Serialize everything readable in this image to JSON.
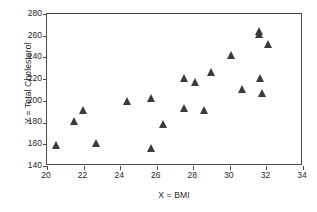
{
  "chart_data": {
    "type": "scatter",
    "title": "",
    "xlabel": "X = BMI",
    "ylabel": "Y = Total Cholesterol",
    "xlim": [
      20,
      34
    ],
    "ylim": [
      140,
      280
    ],
    "xticks": [
      20,
      22,
      24,
      26,
      28,
      30,
      32,
      34
    ],
    "yticks": [
      140,
      160,
      180,
      200,
      220,
      240,
      260,
      280
    ],
    "grid": false,
    "legend": null,
    "marker": "filled-triangle",
    "marker_color": "#3a3a3a",
    "n_points": 20,
    "x": [
      20.5,
      21.5,
      22.0,
      22.7,
      24.4,
      25.7,
      25.7,
      26.4,
      27.5,
      27.5,
      28.1,
      28.6,
      29.0,
      30.1,
      30.7,
      31.6,
      31.6,
      31.7,
      31.8,
      32.1
    ],
    "y": [
      158,
      180,
      190,
      160,
      199,
      201,
      155,
      177,
      220,
      192,
      216,
      190,
      225,
      241,
      210,
      263,
      260,
      220,
      206,
      251
    ],
    "points": [
      {
        "x": 20.5,
        "y": 158
      },
      {
        "x": 21.5,
        "y": 180
      },
      {
        "x": 22.0,
        "y": 190
      },
      {
        "x": 22.7,
        "y": 160
      },
      {
        "x": 24.4,
        "y": 199
      },
      {
        "x": 25.7,
        "y": 201
      },
      {
        "x": 25.7,
        "y": 155
      },
      {
        "x": 26.4,
        "y": 177
      },
      {
        "x": 27.5,
        "y": 220
      },
      {
        "x": 27.5,
        "y": 192
      },
      {
        "x": 28.1,
        "y": 216
      },
      {
        "x": 28.6,
        "y": 190
      },
      {
        "x": 29.0,
        "y": 225
      },
      {
        "x": 30.1,
        "y": 241
      },
      {
        "x": 30.7,
        "y": 210
      },
      {
        "x": 31.6,
        "y": 263
      },
      {
        "x": 31.6,
        "y": 260
      },
      {
        "x": 31.7,
        "y": 220
      },
      {
        "x": 31.8,
        "y": 206
      },
      {
        "x": 32.1,
        "y": 251
      }
    ]
  }
}
